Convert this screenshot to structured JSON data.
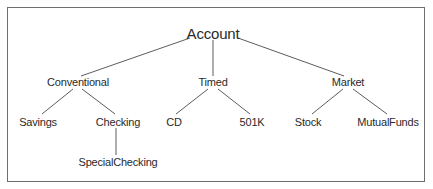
{
  "diagram": {
    "type": "tree",
    "root": "Account",
    "nodes": {
      "account": {
        "label": "Account",
        "x": 213,
        "y": 33,
        "level": 0
      },
      "conventional": {
        "label": "Conventional",
        "x": 78,
        "y": 82,
        "level": 1
      },
      "timed": {
        "label": "Timed",
        "x": 213,
        "y": 82,
        "level": 1
      },
      "market": {
        "label": "Market",
        "x": 348,
        "y": 82,
        "level": 1
      },
      "savings": {
        "label": "Savings",
        "x": 38,
        "y": 122,
        "level": 2
      },
      "checking": {
        "label": "Checking",
        "x": 118,
        "y": 122,
        "level": 2
      },
      "cd": {
        "label": "CD",
        "x": 174,
        "y": 122,
        "level": 2
      },
      "k501": {
        "label": "501K",
        "x": 252,
        "y": 122,
        "level": 2
      },
      "stock": {
        "label": "Stock",
        "x": 308,
        "y": 122,
        "level": 2
      },
      "mutualfunds": {
        "label": "MutualFunds",
        "x": 388,
        "y": 122,
        "level": 2
      },
      "specialchecking": {
        "label": "SpecialChecking",
        "x": 118,
        "y": 162,
        "level": 3
      }
    },
    "edges": [
      [
        "Account",
        "Conventional"
      ],
      [
        "Account",
        "Timed"
      ],
      [
        "Account",
        "Market"
      ],
      [
        "Conventional",
        "Savings"
      ],
      [
        "Conventional",
        "Checking"
      ],
      [
        "Timed",
        "CD"
      ],
      [
        "Timed",
        "501K"
      ],
      [
        "Market",
        "Stock"
      ],
      [
        "Market",
        "MutualFunds"
      ],
      [
        "Checking",
        "SpecialChecking"
      ]
    ],
    "colors": {
      "line": "#4a4a4a",
      "text": "#2a2a2a",
      "border": "#6e6e6e"
    }
  }
}
